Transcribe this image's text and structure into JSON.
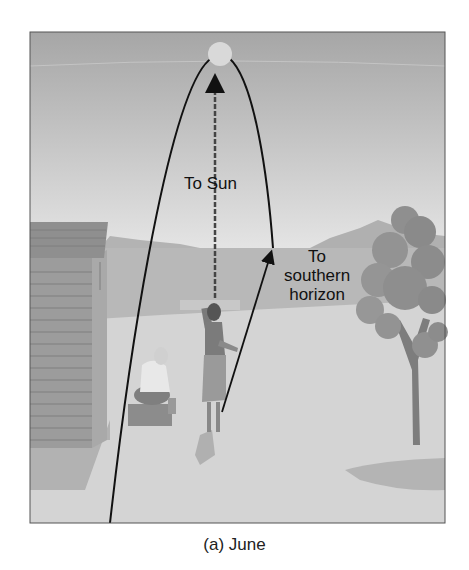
{
  "figure": {
    "caption": "(a) June",
    "labels": {
      "to_sun": "To Sun",
      "to_southern_horizon_line1": "To",
      "to_southern_horizon_line2": "southern",
      "to_southern_horizon_line3": "horizon"
    },
    "elements": [
      "sun",
      "sun-path-arc",
      "to-sun-dashed-arrow",
      "to-horizon-arrow",
      "pointing-woman",
      "seated-person",
      "beach-hut",
      "tree",
      "distant-hills",
      "sea",
      "beach"
    ],
    "colors": {
      "sky_top": "#a9a9a9",
      "sky_bottom": "#e2e2e2",
      "sea": "#b9b9b9",
      "sand": "#d3d3d3",
      "hills": "#b0b0b0",
      "hut": "#9a9a9a",
      "tree": "#8e8e8e",
      "lines": "#111111"
    }
  }
}
